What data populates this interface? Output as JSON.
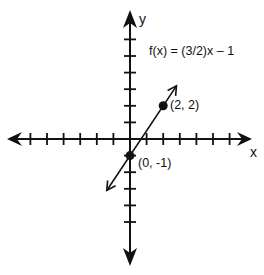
{
  "chart_data": {
    "type": "line",
    "title": "",
    "xlabel": "x",
    "ylabel": "y",
    "function_label": "f(x) = (3/2)x – 1",
    "slope": 1.5,
    "intercept": -1,
    "xlim": [
      -7,
      7
    ],
    "ylim": [
      -6,
      7
    ],
    "grid": false,
    "x_ticks_negative": 6,
    "x_ticks_positive": 6,
    "y_ticks_positive": 6,
    "y_ticks_negative": 5,
    "points": [
      {
        "x": 2,
        "y": 2,
        "label": "(2, 2)"
      },
      {
        "x": 0,
        "y": -1,
        "label": "(0, -1)"
      }
    ],
    "line_segment": {
      "from": [
        -1.4,
        -3.1
      ],
      "to": [
        2.8,
        3.2
      ]
    }
  },
  "labels": {
    "x_axis": "x",
    "y_axis": "y",
    "function": "f(x) = (3/2)x – 1",
    "point_a": "(2, 2)",
    "point_b": "(0, -1)"
  },
  "colors": {
    "ink": "#111111",
    "background": "#ffffff"
  }
}
